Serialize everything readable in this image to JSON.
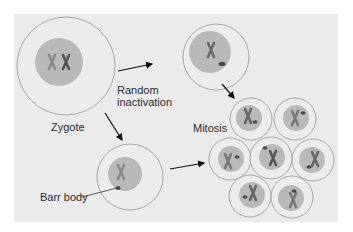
{
  "labels": {
    "zygote": "Zygote",
    "random_inactivation_line1": "Random",
    "random_inactivation_line2": "inactivation",
    "mitosis": "Mitosis",
    "barr_body": "Barr body"
  },
  "colors": {
    "background": "#ebebeb",
    "cell_outline": "#a8a8a8",
    "nucleus": "#b9b9b9",
    "chromosome_active": "#5a5a5a",
    "chromosome_inactive": "#888888",
    "barr_body": "#4a4a4a",
    "arrow": "#111111"
  }
}
